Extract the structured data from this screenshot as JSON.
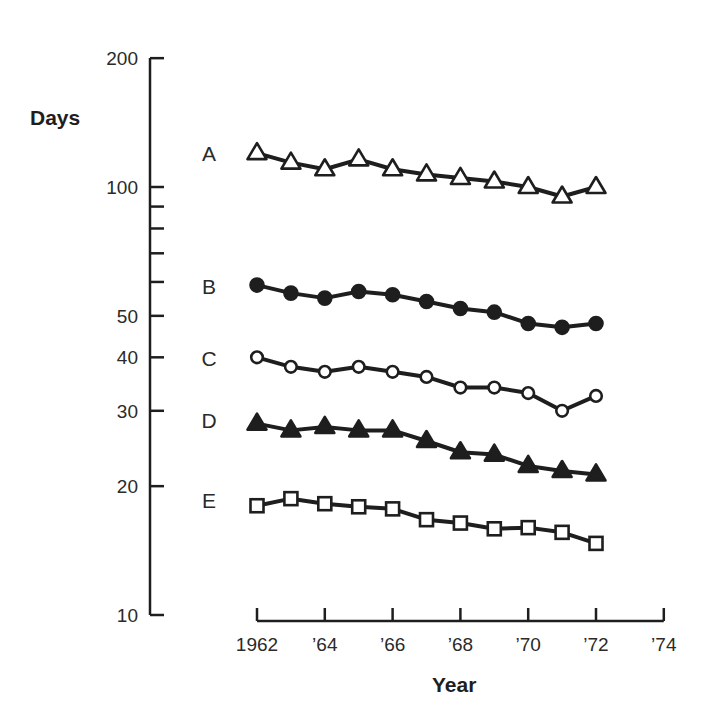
{
  "chart_data": {
    "type": "line",
    "title": "",
    "xlabel": "Year",
    "ylabel": "Days",
    "yscale": "log",
    "ylim": [
      10,
      200
    ],
    "xlim": [
      1962,
      1974
    ],
    "grid": false,
    "legend": "inline letter labels left of each series",
    "y_ticks": [
      {
        "value": 10,
        "label": "10"
      },
      {
        "value": 20,
        "label": "20"
      },
      {
        "value": 30,
        "label": "30"
      },
      {
        "value": 40,
        "label": "40"
      },
      {
        "value": 50,
        "label": "50"
      },
      {
        "value": 60,
        "label": ""
      },
      {
        "value": 70,
        "label": ""
      },
      {
        "value": 80,
        "label": ""
      },
      {
        "value": 90,
        "label": ""
      },
      {
        "value": 100,
        "label": "100"
      },
      {
        "value": 200,
        "label": "200"
      }
    ],
    "x_ticks": [
      {
        "value": 1962,
        "label": "1962"
      },
      {
        "value": 1964,
        "label": "’64"
      },
      {
        "value": 1966,
        "label": "’66"
      },
      {
        "value": 1968,
        "label": "’68"
      },
      {
        "value": 1970,
        "label": "’70"
      },
      {
        "value": 1972,
        "label": "’72"
      },
      {
        "value": 1974,
        "label": "’74"
      }
    ],
    "x": [
      1962,
      1963,
      1964,
      1965,
      1966,
      1967,
      1968,
      1969,
      1970,
      1971,
      1972
    ],
    "series": [
      {
        "name": "A",
        "marker": "open-triangle",
        "values": [
          120,
          114,
          110,
          116,
          110,
          107,
          105,
          103,
          100,
          95,
          100
        ]
      },
      {
        "name": "B",
        "marker": "filled-circle",
        "values": [
          59,
          56.5,
          55,
          57,
          56,
          54,
          52,
          51,
          48,
          47,
          48
        ]
      },
      {
        "name": "C",
        "marker": "open-circle",
        "values": [
          40,
          38,
          37,
          38,
          37,
          36,
          34,
          34,
          33,
          30,
          32.5
        ]
      },
      {
        "name": "D",
        "marker": "filled-triangle",
        "values": [
          28,
          27,
          27.5,
          27,
          27,
          25.5,
          24,
          23.7,
          22.3,
          21.7,
          21.3
        ]
      },
      {
        "name": "E",
        "marker": "open-square",
        "values": [
          18,
          18.7,
          18.2,
          17.9,
          17.7,
          16.7,
          16.4,
          15.9,
          16,
          15.6,
          14.7
        ]
      }
    ]
  },
  "colors": {
    "ink": "#1e1e1e",
    "background": "#ffffff"
  }
}
